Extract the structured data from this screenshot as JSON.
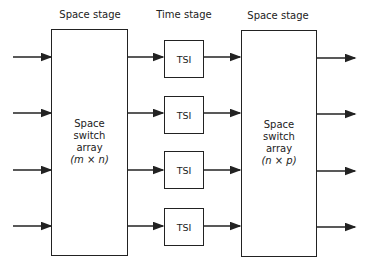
{
  "stages": {
    "left_label": "Space stage",
    "middle_label": "Time stage",
    "right_label": "Space stage"
  },
  "left_switch": {
    "line1": "Space",
    "line2": "switch",
    "line3": "array",
    "dims": "(m  ×  n)"
  },
  "right_switch": {
    "line1": "Space",
    "line2": "switch",
    "line3": "array",
    "dims": "(n  ×  p)"
  },
  "tsi_blocks": [
    {
      "label": "TSI"
    },
    {
      "label": "TSI"
    },
    {
      "label": "TSI"
    },
    {
      "label": "TSI"
    }
  ],
  "line_color": "#222222"
}
